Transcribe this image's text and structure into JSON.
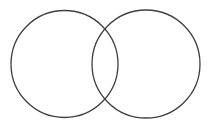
{
  "canvas": {
    "width": 213,
    "height": 126,
    "background_color": "#ffffff"
  },
  "figure": {
    "name": "two-overlapping-circles",
    "stroke_color": "#3f3f42",
    "stroke_width": 1.3,
    "fill": "none",
    "shape_count": 2,
    "labels": []
  },
  "shapes": [
    {
      "id": "left-circle",
      "type": "circle",
      "cx": 64.5,
      "cy": 64,
      "r": 53.5,
      "stroke_color": "#3f3f42",
      "stroke_width": 1.3,
      "fill": "none"
    },
    {
      "id": "right-circle",
      "type": "circle",
      "cx": 146,
      "cy": 64,
      "r": 54,
      "stroke_color": "#3f3f42",
      "stroke_width": 1.3,
      "fill": "none"
    }
  ],
  "geometry": {
    "left_circle_extent_x": [
      11,
      118
    ],
    "right_circle_extent_x": [
      92,
      200
    ],
    "circles_extent_y": [
      10.5,
      117.5
    ],
    "intersection_top_point": [
      105,
      27
    ],
    "intersection_bottom_point": [
      105,
      101
    ],
    "overlap_width": 26
  }
}
